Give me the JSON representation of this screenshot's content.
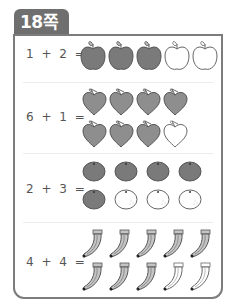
{
  "page_label": "18쪽",
  "colors": {
    "tab": "#6f6f6f",
    "frame_border": "#7c7c7c",
    "filled_fruit": "#7a7a7a",
    "peach_fill": "#8e8e8e",
    "banana_fill": "#c4c4c4",
    "text": "#555555"
  },
  "problems": [
    {
      "equation": "1 + 2 =",
      "fruit": "apple-icon",
      "filled": 3,
      "empty": 2,
      "total": 5,
      "layout": [
        5
      ]
    },
    {
      "equation": "6 + 1 =",
      "fruit": "peach-icon",
      "filled": 7,
      "empty": 1,
      "total": 8,
      "layout": [
        4,
        4
      ]
    },
    {
      "equation": "2 + 3 =",
      "fruit": "tangerine-icon",
      "filled": 5,
      "empty": 3,
      "total": 8,
      "layout": [
        4,
        4
      ]
    },
    {
      "equation": "4 + 4 =",
      "fruit": "banana-icon",
      "filled": 8,
      "empty": 2,
      "total": 10,
      "layout": [
        5,
        5
      ]
    }
  ]
}
